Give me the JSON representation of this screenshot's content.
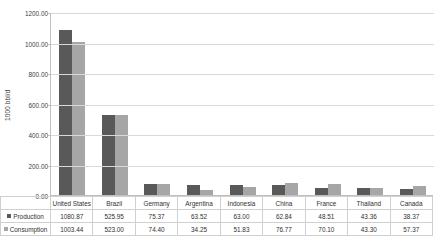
{
  "chart_data": {
    "type": "bar",
    "title": "",
    "xlabel": "",
    "ylabel": "1000 bbl/d",
    "ylim": [
      0,
      1200
    ],
    "ytick_labels": [
      "1200.00",
      "1000.00",
      "800.00",
      "600.00",
      "400.00",
      "200.00",
      "0.00"
    ],
    "yticks": [
      1200,
      1000,
      800,
      600,
      400,
      200,
      0
    ],
    "grid": true,
    "legend_position": "data-table-left",
    "categories": [
      "United States",
      "Brazil",
      "Germany",
      "Argentina",
      "Indonesia",
      "China",
      "France",
      "Thailand",
      "Canada"
    ],
    "series": [
      {
        "name": "Production",
        "color": "#595959",
        "values": [
          1080.87,
          525.95,
          75.37,
          63.52,
          63.0,
          62.84,
          48.51,
          43.36,
          38.37
        ],
        "labels": [
          "1080.87",
          "525.95",
          "75.37",
          "63.52",
          "63.00",
          "62.84",
          "48.51",
          "43.36",
          "38.37"
        ]
      },
      {
        "name": "Consumption",
        "color": "#a6a6a6",
        "values": [
          1003.44,
          523.0,
          74.4,
          34.25,
          51.83,
          76.77,
          70.1,
          43.3,
          57.37
        ],
        "labels": [
          "1003.44",
          "523.00",
          "74.40",
          "34.25",
          "51.83",
          "76.77",
          "70.10",
          "43.30",
          "57.37"
        ]
      }
    ]
  }
}
